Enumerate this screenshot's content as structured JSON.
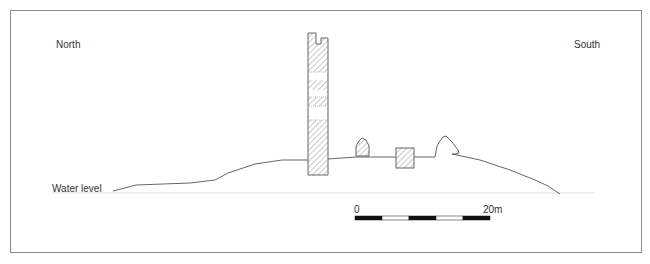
{
  "figure": {
    "type": "profile-section",
    "labels": {
      "left_direction": "North",
      "right_direction": "South",
      "water": "Water level"
    },
    "scale_bar": {
      "start_label": "0",
      "end_label": "20m",
      "segments": [
        "black",
        "white",
        "black",
        "white",
        "black"
      ]
    },
    "features": [
      {
        "name": "tower",
        "fill": "hatched"
      },
      {
        "name": "small-ruin",
        "fill": "hatched"
      },
      {
        "name": "square-block",
        "fill": "hatched"
      },
      {
        "name": "tree-outline",
        "fill": "none"
      }
    ],
    "colors": {
      "line": "#555555",
      "frame": "#8a8a8a",
      "water": "#dddddd",
      "hatch": "#777777"
    }
  }
}
